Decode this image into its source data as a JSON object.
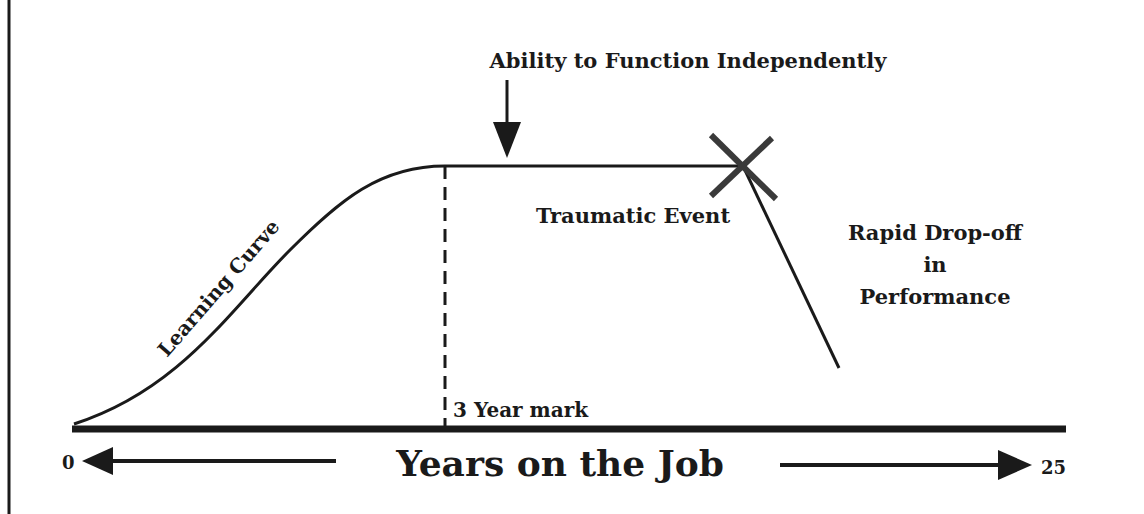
{
  "diagram": {
    "type": "career-performance-curve",
    "colors": {
      "ink": "#1a1a1a",
      "cross": "#3a3a3a",
      "background": "#ffffff"
    },
    "labels": {
      "learning_curve": "Learning Curve",
      "ability": "Ability to Function Independently",
      "traumatic_event": "Traumatic Event",
      "dropoff_line1": "Rapid Drop-off",
      "dropoff_line2": "in",
      "dropoff_line3": "Performance",
      "three_year_mark": "3 Year mark"
    },
    "axis": {
      "title": "Years on the Job",
      "start_label": "0",
      "end_label": "25"
    },
    "markers": [
      {
        "name": "3 Year mark",
        "year": 3,
        "style": "dashed-vertical"
      },
      {
        "name": "Ability to Function Independently",
        "style": "down-arrow"
      },
      {
        "name": "Traumatic Event",
        "style": "x-cross"
      }
    ],
    "phases": [
      "Learning Curve",
      "Plateau",
      "Rapid Drop-off in Performance"
    ]
  }
}
